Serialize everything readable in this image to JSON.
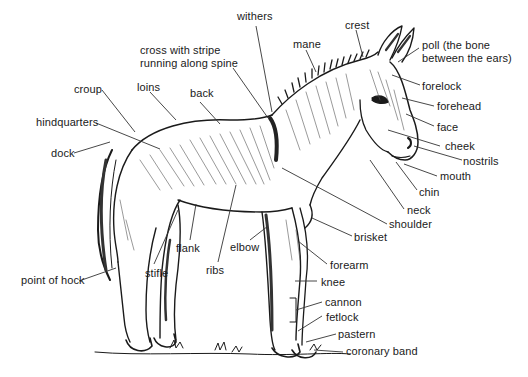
{
  "diagram": {
    "labels": {
      "withers": "withers",
      "cross_line1": "cross with stripe",
      "cross_line2": "running along spine",
      "mane": "mane",
      "crest": "crest",
      "poll_line1": "poll (the bone",
      "poll_line2": "between the ears)",
      "forelock": "forelock",
      "forehead": "forehead",
      "face": "face",
      "cheek": "cheek",
      "nostrils": "nostrils",
      "mouth": "mouth",
      "chin": "chin",
      "neck": "neck",
      "shoulder": "shoulder",
      "brisket": "brisket",
      "forearm": "forearm",
      "knee": "knee",
      "cannon": "cannon",
      "fetlock": "fetlock",
      "pastern": "pastern",
      "coronary_band": "coronary band",
      "croup": "croup",
      "loins": "loins",
      "back": "back",
      "hindquarters": "hindquarters",
      "dock": "dock",
      "flank": "flank",
      "elbow": "elbow",
      "ribs": "ribs",
      "stifle": "stifle",
      "point_of_hock": "point of hock"
    },
    "colors": {
      "ink": "#1a1a1a",
      "leader": "#333333",
      "background": "#ffffff"
    }
  }
}
